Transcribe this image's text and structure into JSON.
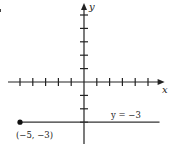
{
  "chart_data": {
    "type": "line",
    "title": "",
    "xlabel": "x",
    "ylabel": "y",
    "xlim": [
      -6,
      6.3
    ],
    "ylim": [
      -4.7,
      5.9
    ],
    "x_ticks": [
      -5,
      -4,
      -3,
      -2,
      -1,
      1,
      2,
      3,
      4,
      5
    ],
    "y_ticks": [
      -3,
      -2,
      -1,
      1,
      2,
      3,
      4,
      5
    ],
    "grid": false,
    "series": [
      {
        "name": "y = -3",
        "x": [
          -5,
          5.9
        ],
        "y": [
          -3,
          -3
        ],
        "label": "y = −3",
        "start_point": {
          "x": -5,
          "y": -3,
          "closed": true
        }
      }
    ],
    "annotations": [
      {
        "text": "(−5, −3)",
        "x": -5,
        "y": -3
      },
      {
        "text": "y = −3",
        "x": 3,
        "y": -3
      }
    ]
  },
  "labels": {
    "x_axis": "x",
    "y_axis": "y",
    "line_label": "y = −3",
    "point_label": "(−5, −3)"
  }
}
